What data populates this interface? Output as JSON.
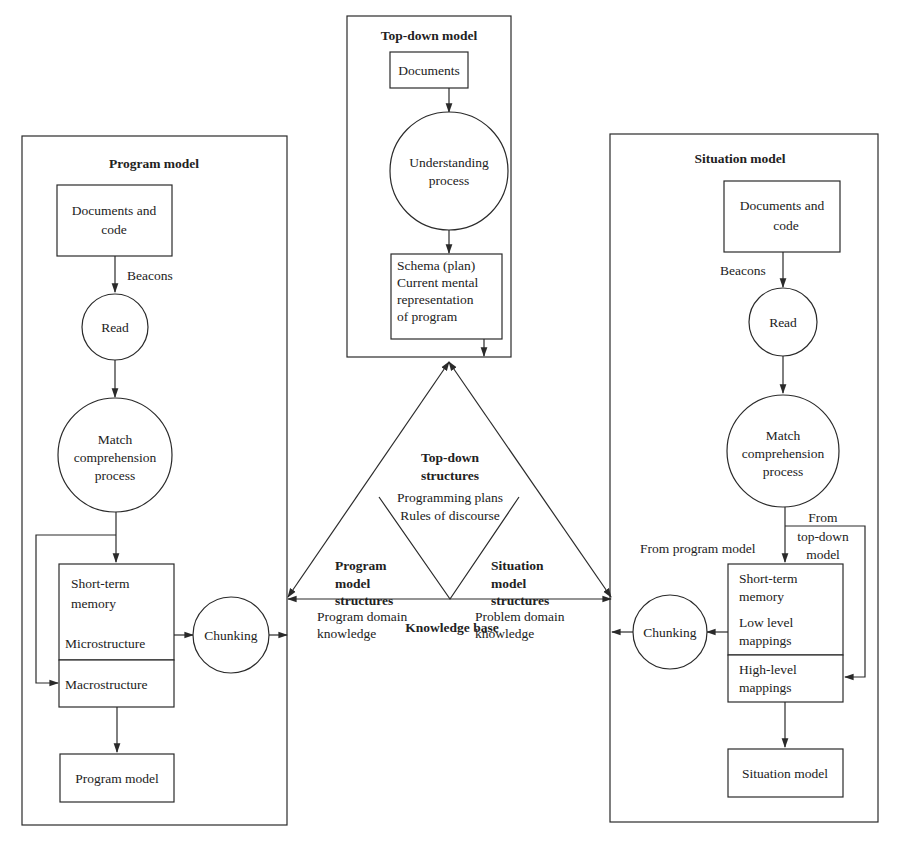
{
  "top_down": {
    "title": "Top-down model",
    "documents": "Documents",
    "process": [
      "Understanding",
      "process"
    ],
    "schema": [
      "Schema (plan)",
      "Current mental",
      "representation",
      "of program"
    ]
  },
  "program": {
    "title": "Program model",
    "docs": [
      "Documents and",
      "code"
    ],
    "beacons": "Beacons",
    "read": "Read",
    "match": [
      "Match",
      "comprehension",
      "process"
    ],
    "stm": [
      "Short-term",
      "memory"
    ],
    "micro": "Microstructure",
    "macro": "Macrostructure",
    "chunking": "Chunking",
    "output": "Program model"
  },
  "situation": {
    "title": "Situation model",
    "docs": [
      "Documents and",
      "code"
    ],
    "beacons": "Beacons",
    "read": "Read",
    "match": [
      "Match",
      "comprehension",
      "process"
    ],
    "from_program": "From program model",
    "from_topdown": [
      "From",
      "top-down",
      "model"
    ],
    "stm": [
      "Short-term",
      "memory"
    ],
    "low": [
      "Low level",
      "mappings"
    ],
    "high": [
      "High-level",
      "mappings"
    ],
    "chunking": "Chunking",
    "output": "Situation model"
  },
  "knowledge": {
    "label": "Knowledge base",
    "top_title": [
      "Top-down",
      "structures"
    ],
    "top_items": [
      "Programming plans",
      "Rules of discourse"
    ],
    "prog_title": [
      "Program",
      "model",
      "structures"
    ],
    "prog_items": [
      "Program domain",
      "knowledge"
    ],
    "sit_title": [
      "Situation",
      "model",
      "structures"
    ],
    "sit_items": [
      "Problem domain",
      "knowledge"
    ]
  }
}
